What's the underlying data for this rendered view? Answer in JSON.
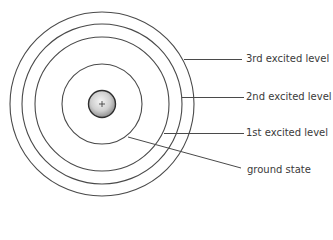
{
  "diagram": {
    "type": "bohr-atom-energy-levels",
    "nucleus": {
      "symbol": "+",
      "fill_center": "#f2f2f2",
      "fill_edge": "#9a9a9a",
      "stroke": "#333333"
    },
    "levels": [
      {
        "name": "ground",
        "label": "ground state"
      },
      {
        "name": "first",
        "label": "1st excited level"
      },
      {
        "name": "second",
        "label": "2nd excited level"
      },
      {
        "name": "third",
        "label": "3rd excited level"
      }
    ],
    "line_color": "#4a4a4a",
    "text_color": "#3a3a3a"
  }
}
